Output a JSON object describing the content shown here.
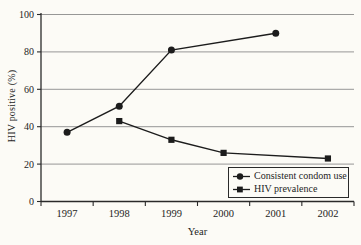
{
  "chart_data": {
    "type": "line",
    "title": "",
    "xlabel": "Year",
    "ylabel": "HIV positive (%)",
    "ylim": [
      0,
      100
    ],
    "y_ticks": [
      0,
      20,
      40,
      60,
      80,
      100
    ],
    "categories": [
      "1997",
      "1998",
      "1999",
      "2000",
      "2001",
      "2002"
    ],
    "grid": "horizontal",
    "legend_position": "inside-bottom-right",
    "series": [
      {
        "name": "Consistent condom use",
        "marker": "circle",
        "points": [
          {
            "x": "1997",
            "y": 37
          },
          {
            "x": "1998",
            "y": 51
          },
          {
            "x": "1999",
            "y": 81
          },
          {
            "x": "2001",
            "y": 90
          }
        ]
      },
      {
        "name": "HIV prevalence",
        "marker": "square",
        "points": [
          {
            "x": "1998",
            "y": 43
          },
          {
            "x": "1999",
            "y": 33
          },
          {
            "x": "2000",
            "y": 26
          },
          {
            "x": "2002",
            "y": 23
          }
        ]
      }
    ],
    "colors": {
      "series": "#1c1c1c",
      "grid": "#8b8b8b",
      "axis": "#2a2a2a",
      "text": "#242424",
      "background": "#fcfbf6"
    }
  }
}
